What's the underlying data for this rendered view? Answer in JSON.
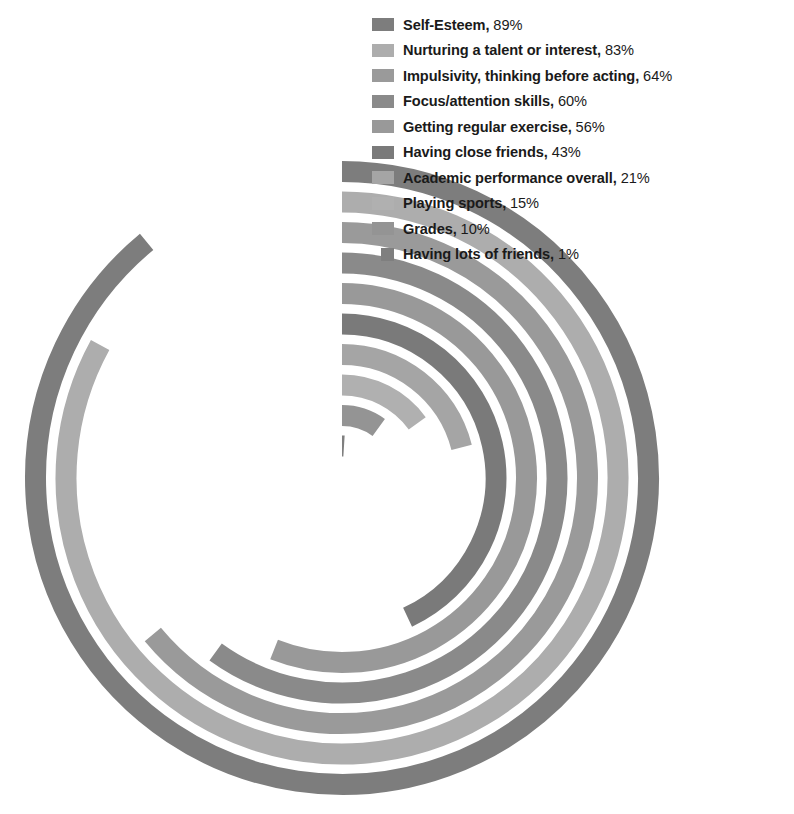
{
  "chart_data": {
    "type": "bar",
    "chart_style": "radial-concentric-arcs",
    "title": "",
    "subtitle": "",
    "xlabel": "",
    "ylabel": "",
    "categories": [
      "Self-Esteem",
      "Nurturing a talent or interest",
      "Impulsivity, thinking before acting",
      "Focus/attention skills",
      "Getting regular exercise",
      "Having close friends",
      "Academic performance overall",
      "Playing sports",
      "Grades",
      "Having lots of friends"
    ],
    "values": [
      89,
      83,
      64,
      60,
      56,
      43,
      21,
      15,
      10,
      1
    ],
    "value_labels": [
      "89%",
      "83%",
      "64%",
      "60%",
      "56%",
      "43%",
      "21%",
      "15%",
      "10%",
      "1%"
    ],
    "unit": "%",
    "ylim": [
      0,
      100
    ],
    "grid": false,
    "legend_position": "top-right",
    "colors": [
      "#7d7d7d",
      "#adadad",
      "#9a9a9a",
      "#8a8a8a",
      "#999999",
      "#7a7a7a",
      "#a5a5a5",
      "#b0b0b0",
      "#949494",
      "#7f7f7f"
    ],
    "series": [
      {
        "name": "Percent of parents",
        "values": [
          89,
          83,
          64,
          60,
          56,
          43,
          21,
          15,
          10,
          1
        ]
      }
    ]
  },
  "legend": {
    "items": [
      {
        "label": "Self-Esteem",
        "value": "89%",
        "separator": ", ",
        "color": "#7d7d7d",
        "size": "normal"
      },
      {
        "label": "Nurturing a talent or interest",
        "value": "83%",
        "separator": ", ",
        "color": "#adadad",
        "size": "normal"
      },
      {
        "label": "Impulsivity, thinking before acting",
        "value": "64%",
        "separator": ", ",
        "color": "#9a9a9a",
        "size": "normal"
      },
      {
        "label": "Focus/attention skills",
        "value": "60%",
        "separator": ", ",
        "color": "#8a8a8a",
        "size": "normal"
      },
      {
        "label": "Getting regular exercise",
        "value": "56%",
        "separator": ", ",
        "color": "#999999",
        "size": "normal"
      },
      {
        "label": "Having close friends",
        "value": "43%",
        "separator": ", ",
        "color": "#7a7a7a",
        "size": "normal"
      },
      {
        "label": "Academic performance overall",
        "value": "21%",
        "separator": ", ",
        "color": "#a5a5a5",
        "size": "normal"
      },
      {
        "label": "Playing sports",
        "value": "15%",
        "separator": ", ",
        "color": "#b0b0b0",
        "size": "normal"
      },
      {
        "label": "Grades",
        "value": "10%",
        "separator": ", ",
        "color": "#949494",
        "size": "normal"
      },
      {
        "label": "Having lots of friends",
        "value": "1%",
        "separator": ", ",
        "color": "#7f7f7f",
        "size": "small"
      }
    ]
  },
  "geometry": {
    "center_x": 342,
    "center_y": 478,
    "outer_radius": 317,
    "band_width": 21,
    "band_gap": 9.5,
    "start_angle_deg": -90
  }
}
